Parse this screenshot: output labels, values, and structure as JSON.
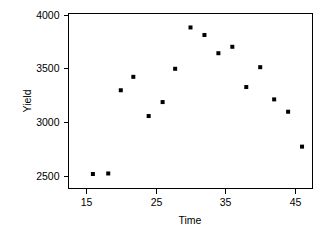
{
  "chart_data": {
    "type": "scatter",
    "title": "",
    "subtitle": "",
    "xlabel": "Time",
    "ylabel": "Yield",
    "xlim": [
      12.5,
      47.5
    ],
    "ylim": [
      2380,
      4010
    ],
    "xticks": [
      15,
      25,
      35,
      45
    ],
    "yticks": [
      2500,
      3000,
      3500,
      4000
    ],
    "xtick_labels": [
      "15",
      "25",
      "35",
      "45"
    ],
    "ytick_labels": [
      "2500",
      "3000",
      "3500",
      "4000"
    ],
    "grid": false,
    "legend": false,
    "legend_position": "none",
    "marker": "square",
    "marker_color": "#000000",
    "marker_size": 4,
    "frame": true,
    "x": [
      16.0,
      18.2,
      20.0,
      21.8,
      24.0,
      26.0,
      27.8,
      30.0,
      32.0,
      34.0,
      36.0,
      38.0,
      40.0,
      42.0,
      44.0,
      46.0
    ],
    "y": [
      2515,
      2520,
      3295,
      3420,
      3055,
      3185,
      3495,
      3880,
      3810,
      3640,
      3700,
      3325,
      3510,
      3210,
      3095,
      2770
    ],
    "points": [
      {
        "x": 16.0,
        "y": 2515
      },
      {
        "x": 18.2,
        "y": 2520
      },
      {
        "x": 20.0,
        "y": 3295
      },
      {
        "x": 21.8,
        "y": 3420
      },
      {
        "x": 24.0,
        "y": 3055
      },
      {
        "x": 26.0,
        "y": 3185
      },
      {
        "x": 27.8,
        "y": 3495
      },
      {
        "x": 30.0,
        "y": 3880
      },
      {
        "x": 32.0,
        "y": 3810
      },
      {
        "x": 34.0,
        "y": 3640
      },
      {
        "x": 36.0,
        "y": 3700
      },
      {
        "x": 38.0,
        "y": 3325
      },
      {
        "x": 40.0,
        "y": 3510
      },
      {
        "x": 42.0,
        "y": 3210
      },
      {
        "x": 44.0,
        "y": 3095
      },
      {
        "x": 46.0,
        "y": 2770
      }
    ]
  },
  "axes": {
    "y_axis_title": "Yield",
    "x_axis_title": "Time"
  },
  "colors": {
    "background": "#ffffff",
    "foreground": "#000000",
    "marker": "#000000",
    "frame": "#000000"
  }
}
